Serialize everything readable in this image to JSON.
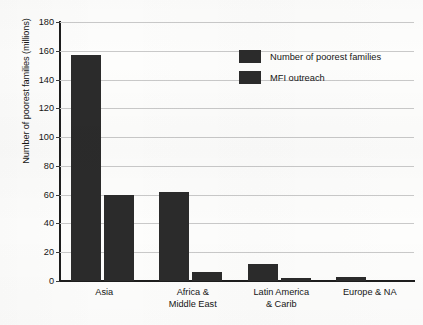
{
  "chart_data": {
    "type": "bar",
    "title": "",
    "subtitle": "",
    "xlabel": "",
    "ylabel": "Number of poorest families (millions)",
    "ylim": [
      0,
      180
    ],
    "ytick_step": 20,
    "yticks": [
      0,
      20,
      40,
      60,
      80,
      100,
      120,
      140,
      160,
      180
    ],
    "ytick_labels": [
      "0",
      "20",
      "40",
      "60",
      "80",
      "100",
      "120",
      "140",
      "160",
      "180"
    ],
    "grid": true,
    "grid_axis": "y",
    "legend_position": "top-right-inside",
    "categories": [
      "Asia",
      "Africa & Middle East",
      "Latin America & Carib",
      "Europe & NA"
    ],
    "category_label_lines": [
      [
        "Asia"
      ],
      [
        "Africa &",
        "Middle East"
      ],
      [
        "Latin America",
        "& Carib"
      ],
      [
        "Europe & NA"
      ]
    ],
    "series": [
      {
        "name": "Number of poorest families",
        "color": "#2b2b2b",
        "values": [
          157,
          62,
          12,
          3
        ]
      },
      {
        "name": "MFI outreach",
        "color": "#2b2b2b",
        "values": [
          60,
          6,
          2,
          0
        ]
      }
    ]
  },
  "legend": {
    "items": [
      {
        "label": "Number of poorest families",
        "color": "#2b2b2b"
      },
      {
        "label": "MFI outreach",
        "color": "#2b2b2b"
      }
    ]
  },
  "axes": {
    "y_title": "Number of poorest families (millions)"
  },
  "colors": {
    "bar": "#2b2b2b",
    "grid": "#c9c9c9",
    "axis": "#1d1d1d",
    "background": "#fdfdfc",
    "text": "#151515"
  }
}
